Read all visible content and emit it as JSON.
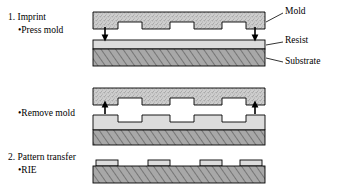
{
  "figure": {
    "steps": [
      {
        "number_label": "1. Imprint",
        "bullets": [
          "•Press mold"
        ]
      },
      {
        "number_label": "",
        "bullets": [
          "•Remove mold"
        ]
      },
      {
        "number_label": "2. Pattern transfer",
        "bullets": [
          "•RIE"
        ]
      }
    ],
    "callouts": {
      "mold": "Mold",
      "resist": "Resist",
      "substrate": "Substrate"
    },
    "colors": {
      "mold_fill": "#cfcfcf",
      "resist_fill": "#dcdcdc",
      "substrate_fill": "#a8a8a8",
      "outline": "#000000",
      "arrow": "#000000",
      "background": "#ffffff"
    },
    "panels": [
      {
        "name": "press-mold",
        "mold_teeth": 3,
        "arrow_direction": "down",
        "arrow_count": 2,
        "resist_patterned": false
      },
      {
        "name": "remove-mold",
        "mold_teeth": 3,
        "arrow_direction": "up",
        "arrow_count": 2,
        "resist_patterned": true
      },
      {
        "name": "rie",
        "mold_teeth": 0,
        "arrow_direction": "none",
        "arrow_count": 0,
        "resist_pads": 4
      }
    ]
  }
}
